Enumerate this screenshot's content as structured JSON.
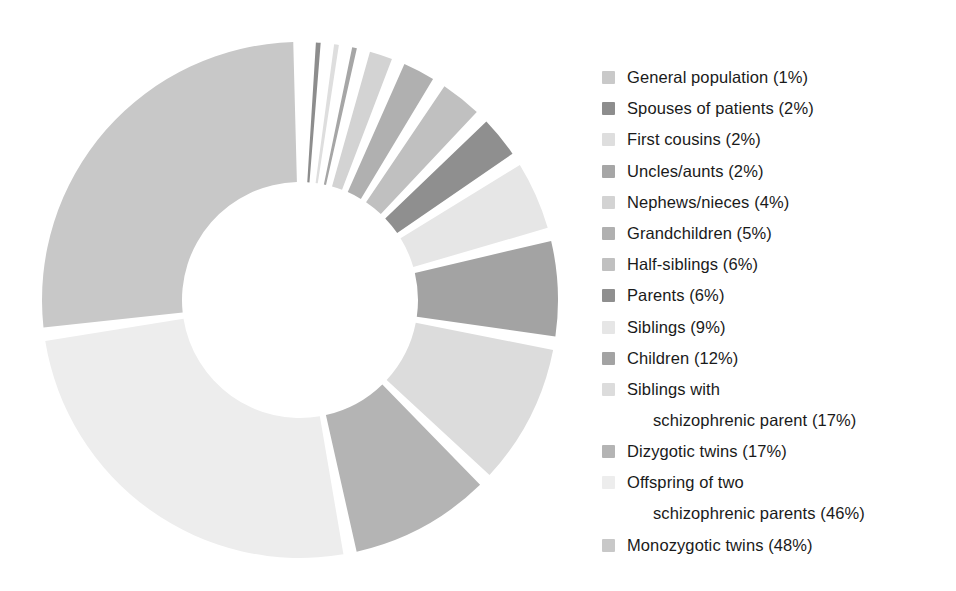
{
  "chart_data": {
    "type": "pie",
    "title": "",
    "subtitle": "",
    "xlabel": "",
    "ylabel": "",
    "legend_position": "right",
    "grid": false,
    "value_unit": "%",
    "donut": true,
    "inner_radius_ratio": 0.45,
    "start_angle_deg": -90,
    "direction": "clockwise",
    "gap_deg": 3,
    "categories": [
      "General population",
      "Spouses of patients",
      "First cousins",
      "Uncles/aunts",
      "Nephews/nieces",
      "Grandchildren",
      "Half-siblings",
      "Parents",
      "Siblings",
      "Children",
      "Siblings with schizophrenic parent",
      "Dizygotic twins",
      "Offspring of two schizophrenic parents",
      "Monozygotic twins"
    ],
    "values": [
      1,
      2,
      2,
      2,
      4,
      5,
      6,
      6,
      9,
      12,
      17,
      17,
      46,
      48
    ],
    "colors": [
      "#c9c9c9",
      "#8d8d8d",
      "#dedede",
      "#a6a6a6",
      "#d3d3d3",
      "#b0b0b0",
      "#c0c0c0",
      "#8f8f8f",
      "#e6e6e6",
      "#a3a3a3",
      "#dcdcdc",
      "#b4b4b4",
      "#ededed",
      "#c8c8c8"
    ]
  },
  "legend": {
    "items": [
      {
        "label": "General population (1%)",
        "name": "General population",
        "value": 1,
        "color": "#c9c9c9",
        "lines": [
          "General population (1%)"
        ]
      },
      {
        "label": "Spouses of patients (2%)",
        "name": "Spouses of patients",
        "value": 2,
        "color": "#8d8d8d",
        "lines": [
          "Spouses of patients (2%)"
        ]
      },
      {
        "label": "First cousins (2%)",
        "name": "First cousins",
        "value": 2,
        "color": "#dedede",
        "lines": [
          "First cousins (2%)"
        ]
      },
      {
        "label": "Uncles/aunts (2%)",
        "name": "Uncles/aunts",
        "value": 2,
        "color": "#a6a6a6",
        "lines": [
          "Uncles/aunts (2%)"
        ]
      },
      {
        "label": "Nephews/nieces (4%)",
        "name": "Nephews/nieces",
        "value": 4,
        "color": "#d3d3d3",
        "lines": [
          "Nephews/nieces (4%)"
        ]
      },
      {
        "label": "Grandchildren (5%)",
        "name": "Grandchildren",
        "value": 5,
        "color": "#b0b0b0",
        "lines": [
          "Grandchildren (5%)"
        ]
      },
      {
        "label": "Half-siblings (6%)",
        "name": "Half-siblings",
        "value": 6,
        "color": "#c0c0c0",
        "lines": [
          "Half-siblings (6%)"
        ]
      },
      {
        "label": "Parents (6%)",
        "name": "Parents",
        "value": 6,
        "color": "#8f8f8f",
        "lines": [
          "Parents (6%)"
        ]
      },
      {
        "label": "Siblings (9%)",
        "name": "Siblings",
        "value": 9,
        "color": "#e6e6e6",
        "lines": [
          "Siblings (9%)"
        ]
      },
      {
        "label": "Children (12%)",
        "name": "Children",
        "value": 12,
        "color": "#a3a3a3",
        "lines": [
          "Children (12%)"
        ]
      },
      {
        "label": "Siblings with schizophrenic parent (17%)",
        "name": "Siblings with schizophrenic parent",
        "value": 17,
        "color": "#dcdcdc",
        "lines": [
          "Siblings with",
          "schizophrenic parent (17%)"
        ]
      },
      {
        "label": "Dizygotic twins (17%)",
        "name": "Dizygotic twins",
        "value": 17,
        "color": "#b4b4b4",
        "lines": [
          "Dizygotic twins (17%)"
        ]
      },
      {
        "label": "Offspring of two schizophrenic parents (46%)",
        "name": "Offspring of two schizophrenic parents",
        "value": 46,
        "color": "#ededed",
        "lines": [
          "Offspring of two",
          "schizophrenic parents (46%)"
        ]
      },
      {
        "label": "Monozygotic twins (48%)",
        "name": "Monozygotic twins",
        "value": 48,
        "color": "#c8c8c8",
        "lines": [
          "Monozygotic twins (48%)"
        ]
      }
    ]
  }
}
